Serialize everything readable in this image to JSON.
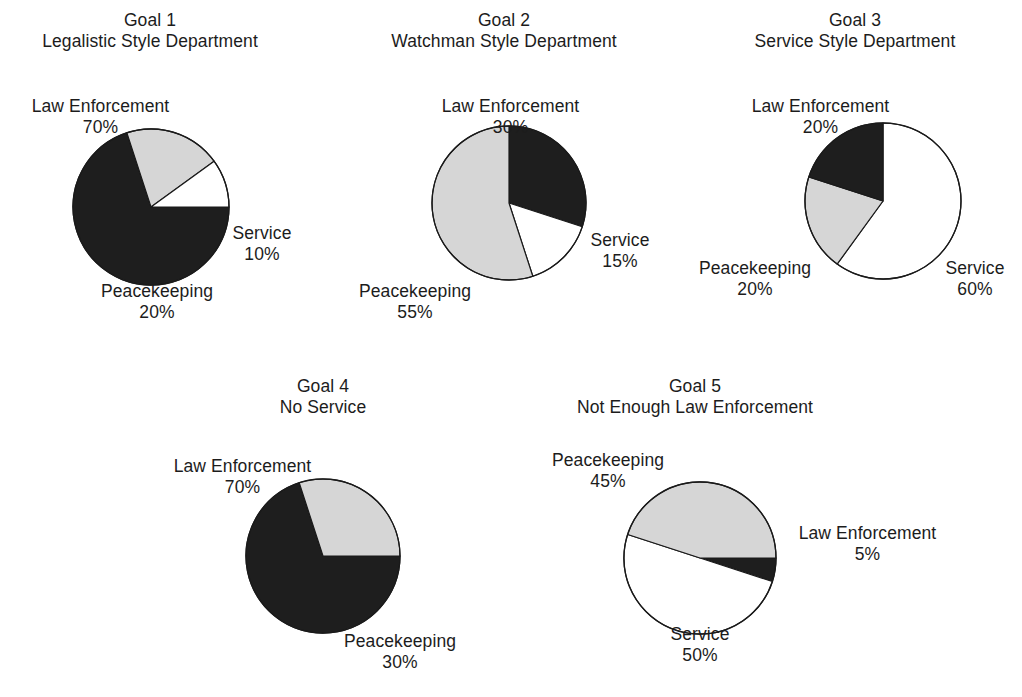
{
  "figure": {
    "background": "#ffffff",
    "text_color": "#1c1c1c"
  },
  "palette": {
    "law_enforcement": "#1e1e1e",
    "peacekeeping": "#d6d6d6",
    "service": "#ffffff",
    "outline": "#1a1a1a"
  },
  "charts": [
    {
      "id": "goal-1",
      "title_line1": "Goal 1",
      "title_line2": "Legalistic Style Department",
      "labels": {
        "law_name": "Law Enforcement",
        "law_pct": "70%",
        "peace_name": "Peacekeeping",
        "peace_pct": "20%",
        "service_name": "Service",
        "service_pct": "10%"
      }
    },
    {
      "id": "goal-2",
      "title_line1": "Goal 2",
      "title_line2": "Watchman Style Department",
      "labels": {
        "law_name": "Law Enforcement",
        "law_pct": "30%",
        "peace_name": "Peacekeeping",
        "peace_pct": "55%",
        "service_name": "Service",
        "service_pct": "15%"
      }
    },
    {
      "id": "goal-3",
      "title_line1": "Goal 3",
      "title_line2": "Service Style Department",
      "labels": {
        "law_name": "Law Enforcement",
        "law_pct": "20%",
        "peace_name": "Peacekeeping",
        "peace_pct": "20%",
        "service_name": "Service",
        "service_pct": "60%"
      }
    },
    {
      "id": "goal-4",
      "title_line1": "Goal 4",
      "title_line2": "No Service",
      "labels": {
        "law_name": "Law Enforcement",
        "law_pct": "70%",
        "peace_name": "Peacekeeping",
        "peace_pct": "30%"
      }
    },
    {
      "id": "goal-5",
      "title_line1": "Goal 5",
      "title_line2": "Not Enough Law Enforcement",
      "labels": {
        "law_name": "Law Enforcement",
        "law_pct": "5%",
        "peace_name": "Peacekeeping",
        "peace_pct": "45%",
        "service_name": "Service",
        "service_pct": "50%"
      }
    }
  ],
  "chart_data": [
    {
      "type": "pie",
      "title": "Goal 1 — Legalistic Style Department",
      "labels": [
        "Law Enforcement",
        "Peacekeeping",
        "Service"
      ],
      "values": [
        70,
        20,
        10
      ],
      "unit": "%",
      "colors": [
        "#1e1e1e",
        "#d6d6d6",
        "#ffffff"
      ],
      "start_angle_deg": 0,
      "direction": "clockwise",
      "legend": "outside-labels",
      "center_px": [
        151,
        207
      ],
      "radius_px": 74
    },
    {
      "type": "pie",
      "title": "Goal 2 — Watchman Style Department",
      "labels": [
        "Law Enforcement",
        "Service",
        "Peacekeeping"
      ],
      "values": [
        30,
        15,
        55
      ],
      "unit": "%",
      "colors": [
        "#1e1e1e",
        "#ffffff",
        "#d6d6d6"
      ],
      "start_angle_deg": -90,
      "direction": "clockwise",
      "legend": "outside-labels",
      "center_px": [
        509,
        203
      ],
      "radius_px": 73
    },
    {
      "type": "pie",
      "title": "Goal 3 — Service Style Department",
      "labels": [
        "Service",
        "Peacekeeping",
        "Law Enforcement"
      ],
      "values": [
        60,
        20,
        20
      ],
      "unit": "%",
      "colors": [
        "#ffffff",
        "#d6d6d6",
        "#1e1e1e"
      ],
      "start_angle_deg": -90,
      "direction": "clockwise",
      "legend": "outside-labels",
      "center_px": [
        877,
        201
      ],
      "radius_px": 74
    },
    {
      "type": "pie",
      "title": "Goal 4 — No Service",
      "labels": [
        "Law Enforcement",
        "Peacekeeping"
      ],
      "values": [
        70,
        30
      ],
      "unit": "%",
      "colors": [
        "#1e1e1e",
        "#d6d6d6"
      ],
      "start_angle_deg": 0,
      "direction": "clockwise",
      "legend": "outside-labels",
      "center_px": [
        323,
        556
      ],
      "radius_px": 73
    },
    {
      "type": "pie",
      "title": "Goal 5 — Not Enough Law Enforcement",
      "labels": [
        "Law Enforcement",
        "Service",
        "Peacekeeping"
      ],
      "values": [
        5,
        50,
        45
      ],
      "unit": "%",
      "colors": [
        "#1e1e1e",
        "#ffffff",
        "#d6d6d6"
      ],
      "start_angle_deg": 0,
      "direction": "clockwise",
      "legend": "outside-labels",
      "center_px": [
        695,
        553
      ],
      "radius_px": 72
    }
  ]
}
